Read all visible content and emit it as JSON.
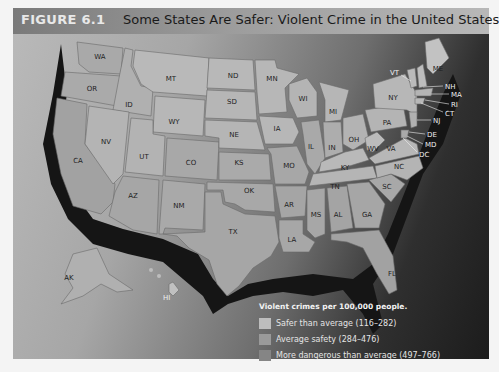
{
  "figure": {
    "label": "FIGURE 6.1",
    "title": "Some States Are Safer: Violent Crime in the United States"
  },
  "legend": {
    "title": "Violent crimes per 100,000 people.",
    "items": [
      {
        "label": "Safer than average (116–282)",
        "color": "#bdbdbd"
      },
      {
        "label": "Average safety (284–476)",
        "color": "#9a9a9a"
      },
      {
        "label": "More dangerous than average (497–766)",
        "color": "#858585"
      }
    ]
  },
  "states": {
    "WA": "WA",
    "OR": "OR",
    "CA": "CA",
    "ID": "ID",
    "NV": "NV",
    "MT": "MT",
    "WY": "WY",
    "UT": "UT",
    "AZ": "AZ",
    "CO": "CO",
    "NM": "NM",
    "ND": "ND",
    "SD": "SD",
    "NE": "NE",
    "KS": "KS",
    "OK": "OK",
    "TX": "TX",
    "MN": "MN",
    "IA": "IA",
    "MO": "MO",
    "AR": "AR",
    "LA": "LA",
    "WI": "WI",
    "IL": "IL",
    "MI": "MI",
    "IN": "IN",
    "OH": "OH",
    "KY": "KY",
    "TN": "TN",
    "MS": "MS",
    "AL": "AL",
    "GA": "GA",
    "FL": "FL",
    "SC": "SC",
    "NC": "NC",
    "VA": "VA",
    "WV": "WV",
    "PA": "PA",
    "NY": "NY",
    "VT": "VT",
    "NH": "NH",
    "ME": "ME",
    "MA": "MA",
    "RI": "RI",
    "CT": "CT",
    "NJ": "NJ",
    "DE": "DE",
    "MD": "MD",
    "DC": "DC",
    "AK": "AK",
    "HI": "HI"
  }
}
